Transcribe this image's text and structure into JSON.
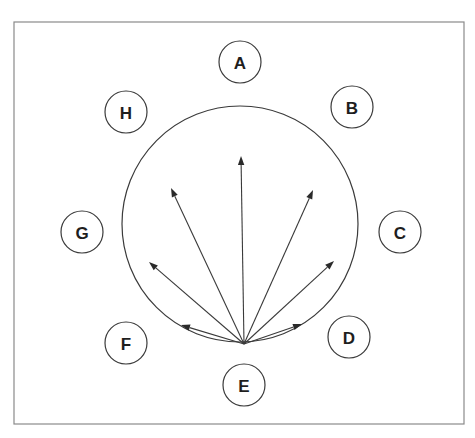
{
  "diagram": {
    "type": "radial-vector-diagram",
    "frame": {
      "x": 14,
      "y": 22,
      "width": 450,
      "height": 402,
      "stroke": "#8a8a8a"
    },
    "big_circle": {
      "cx": 240,
      "cy": 224,
      "r": 118,
      "stroke": "#3a3a3a"
    },
    "origin": {
      "x": 244,
      "y": 344
    },
    "nodes": [
      {
        "id": "A",
        "label": "A",
        "cx": 240,
        "cy": 62,
        "r": 21
      },
      {
        "id": "B",
        "label": "B",
        "cx": 352,
        "cy": 107,
        "r": 21
      },
      {
        "id": "C",
        "label": "C",
        "cx": 400,
        "cy": 232,
        "r": 21
      },
      {
        "id": "D",
        "label": "D",
        "cx": 349,
        "cy": 337,
        "r": 21
      },
      {
        "id": "E",
        "label": "E",
        "cx": 244,
        "cy": 385,
        "r": 21
      },
      {
        "id": "F",
        "label": "F",
        "cx": 126,
        "cy": 343,
        "r": 21
      },
      {
        "id": "G",
        "label": "G",
        "cx": 82,
        "cy": 232,
        "r": 21
      },
      {
        "id": "H",
        "label": "H",
        "cx": 126,
        "cy": 112,
        "r": 21
      }
    ],
    "arrows": [
      {
        "id": "arrow-up",
        "x2": 241,
        "y2": 156
      },
      {
        "id": "arrow-upper-left",
        "x2": 171,
        "y2": 188
      },
      {
        "id": "arrow-upper-right",
        "x2": 313,
        "y2": 190
      },
      {
        "id": "arrow-left",
        "x2": 149,
        "y2": 262
      },
      {
        "id": "arrow-right",
        "x2": 334,
        "y2": 261
      },
      {
        "id": "arrow-lower-left",
        "x2": 181,
        "y2": 325
      },
      {
        "id": "arrow-lower-right",
        "x2": 302,
        "y2": 324
      }
    ]
  }
}
